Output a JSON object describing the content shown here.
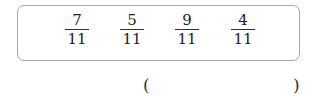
{
  "fractions": [
    {
      "numerator": "7",
      "denominator": "11"
    },
    {
      "numerator": "5",
      "denominator": "11"
    },
    {
      "numerator": "9",
      "denominator": "11"
    },
    {
      "numerator": "4",
      "denominator": "11"
    }
  ],
  "answer": {
    "open_paren": "(",
    "close_paren": ")",
    "value": ""
  }
}
